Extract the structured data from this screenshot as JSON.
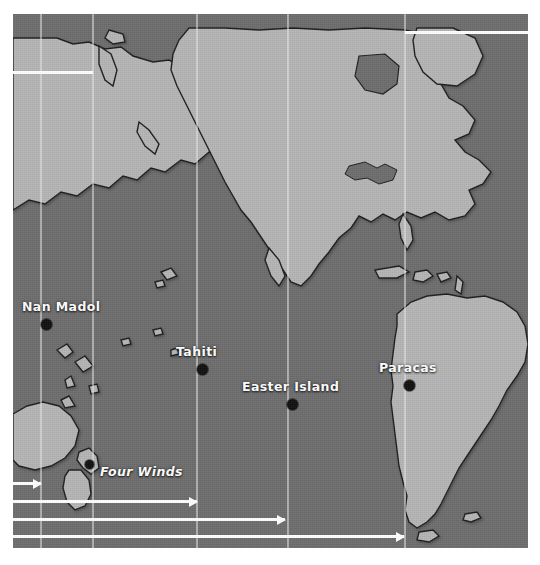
{
  "figure": {
    "projection": "equirectangular",
    "colors": {
      "ocean": "#6e6e6e",
      "land": "#b5b5b5",
      "land_shadow": "#8f8f8f",
      "coastline": "#1f1f1f",
      "route": "#ffffff",
      "gridline": "#e6e6e6",
      "marker": "#111111",
      "label": "#ffffff",
      "page_background": "#ffffff"
    },
    "frame": {
      "left": 13,
      "top": 14,
      "width": 515,
      "height": 534
    }
  },
  "gridlines": [
    {
      "name": "meridian-1",
      "x": 27
    },
    {
      "name": "meridian-2",
      "x": 79
    },
    {
      "name": "meridian-3",
      "x": 183
    },
    {
      "name": "meridian-4",
      "x": 274
    },
    {
      "name": "meridian-5",
      "x": 391
    }
  ],
  "sites": [
    {
      "name": "Nan Madol",
      "label": "Nan Madol",
      "italic": false,
      "dot": {
        "x": 28,
        "y": 305
      },
      "label_pos": {
        "x": 9,
        "y": 290
      }
    },
    {
      "name": "Tahiti",
      "label": "Tahiti",
      "italic": false,
      "dot": {
        "x": 184,
        "y": 350
      },
      "label_pos": {
        "x": 163,
        "y": 334
      }
    },
    {
      "name": "Easter Island",
      "label": "Easter Island",
      "italic": false,
      "dot": {
        "x": 274,
        "y": 385
      },
      "label_pos": {
        "x": 229,
        "y": 377
      }
    },
    {
      "name": "Paracas",
      "label": "Paracas",
      "italic": false,
      "dot": {
        "x": 391,
        "y": 366
      },
      "label_pos": {
        "x": 368,
        "y": 350
      }
    },
    {
      "name": "Four Winds",
      "label": "Four Winds",
      "italic": true,
      "dot": {
        "x": 75,
        "y": 449
      },
      "label_pos": {
        "x": 87,
        "y": 455
      }
    }
  ],
  "routes": [
    {
      "name": "route-north-pacific",
      "y": 57,
      "x_start": 0,
      "x_end": 80,
      "arrowhead": false
    },
    {
      "name": "route-north-atlantic",
      "y": 17,
      "x_start": 392,
      "x_end": 515,
      "arrowhead": false
    },
    {
      "name": "route-tasman-short",
      "y": 468,
      "x_start": 0,
      "x_end": 28,
      "arrowhead": true
    },
    {
      "name": "route-to-tahiti",
      "y": 486,
      "x_start": 0,
      "x_end": 184,
      "arrowhead": true
    },
    {
      "name": "route-to-easter-island",
      "y": 504,
      "x_start": 0,
      "x_end": 272,
      "arrowhead": true
    },
    {
      "name": "route-to-south-america",
      "y": 521,
      "x_start": 0,
      "x_end": 391,
      "arrowhead": true
    }
  ],
  "landmasses": [
    {
      "name": "north-america",
      "region": "northern"
    },
    {
      "name": "south-america",
      "region": "southern"
    },
    {
      "name": "asia-far-east",
      "region": "northwest"
    },
    {
      "name": "australia",
      "region": "southwest"
    },
    {
      "name": "new-zealand",
      "region": "southwest"
    },
    {
      "name": "greenland",
      "region": "northeast"
    },
    {
      "name": "micronesia-islands",
      "region": "west-pacific"
    },
    {
      "name": "polynesia-islands",
      "region": "central-pacific"
    },
    {
      "name": "caribbean-islands",
      "region": "east"
    }
  ]
}
